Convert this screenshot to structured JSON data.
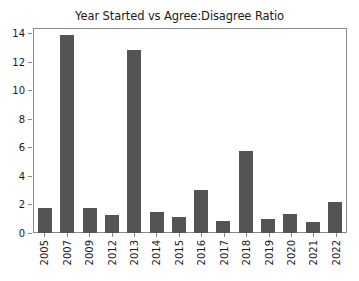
{
  "chart_data": {
    "type": "bar",
    "title": "Year Started vs Agree:Disagree Ratio",
    "xlabel": "",
    "ylabel": "",
    "categories": [
      "2005",
      "2007",
      "2009",
      "2012",
      "2013",
      "2014",
      "2015",
      "2016",
      "2017",
      "2018",
      "2019",
      "2020",
      "2021",
      "2022"
    ],
    "values": [
      1.75,
      13.9,
      1.75,
      1.25,
      12.85,
      1.45,
      1.1,
      3.0,
      0.85,
      5.75,
      1.0,
      1.35,
      0.8,
      2.2
    ],
    "yticks": [
      0,
      2,
      4,
      6,
      8,
      10,
      12,
      14
    ],
    "ylim": [
      0,
      14.35
    ],
    "grid": false,
    "legend": null,
    "bar_color": "#545454",
    "axes_color": "#8a8a8a",
    "background_color": "#ffffff",
    "xtick_rotation": 90
  }
}
